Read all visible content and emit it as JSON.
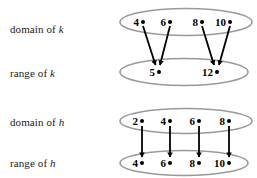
{
  "figure": {
    "title_text": "",
    "background_color": "#ffffff",
    "ellipse_color": "#9a9a9a",
    "arrow_color": "#000000",
    "text_color": "#1a1a1a"
  },
  "rows": [
    {
      "id": "domain-of-k",
      "label_prefix": "domain of ",
      "label_var": "k",
      "elements": [
        "4",
        "6",
        "8",
        "10"
      ]
    },
    {
      "id": "range-of-k",
      "label_prefix": "range of ",
      "label_var": "k",
      "elements": [
        "5",
        "12"
      ]
    },
    {
      "id": "domain-of-h",
      "label_prefix": "domain of ",
      "label_var": "h",
      "elements": [
        "2",
        "4",
        "6",
        "8"
      ]
    },
    {
      "id": "range-of-h",
      "label_prefix": "range of ",
      "label_var": "h",
      "elements": [
        "4",
        "6",
        "8",
        "10"
      ]
    }
  ],
  "mappings": {
    "k": [
      {
        "from": "4",
        "to": "5"
      },
      {
        "from": "6",
        "to": "5"
      },
      {
        "from": "8",
        "to": "12"
      },
      {
        "from": "10",
        "to": "12"
      }
    ],
    "h": [
      {
        "from": "2",
        "to": "4"
      },
      {
        "from": "4",
        "to": "6"
      },
      {
        "from": "6",
        "to": "8"
      },
      {
        "from": "8",
        "to": "10"
      }
    ]
  },
  "labels": {
    "domain_of_k": "domain of k",
    "range_of_k": "range of k",
    "domain_of_h": "domain of h",
    "range_of_h": "range of h"
  }
}
